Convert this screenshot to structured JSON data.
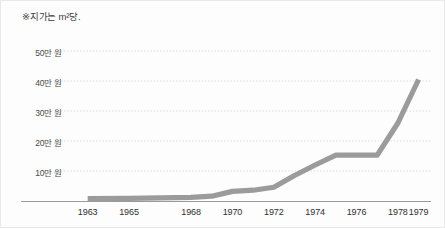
{
  "figure": {
    "note": "※지가는 m²당.",
    "background_color": "#fdfdfd",
    "border_color": "#e9e9e9"
  },
  "chart_data": {
    "type": "line",
    "title": "",
    "subtitle": "",
    "note": "※지가는 m²당.",
    "xlabel": "",
    "ylabel": "",
    "unit": "만 원",
    "line_color": "#9b9b9b",
    "grid_color": "#dcdcdc",
    "axis_color": "#9a9a9a",
    "grid": true,
    "legend": "none",
    "xlim": [
      1962,
      1979.6
    ],
    "ylim": [
      0,
      55
    ],
    "ytick_labels": [
      "50만 원",
      "40만 원",
      "30만 원",
      "20만 원",
      "10만 원"
    ],
    "ytick_values": [
      50,
      40,
      30,
      20,
      10
    ],
    "xtick_labels": [
      "1963",
      "1965",
      "1968",
      "1970",
      "1972",
      "1974",
      "1976",
      "1978",
      "1979"
    ],
    "xtick_values": [
      1963,
      1965,
      1968,
      1970,
      1972,
      1974,
      1976,
      1978,
      1979
    ],
    "x": [
      1963,
      1965,
      1968,
      1969,
      1970,
      1971,
      1972,
      1973,
      1974,
      1975,
      1977,
      1978,
      1979
    ],
    "values": [
      0.8,
      0.9,
      1.2,
      1.6,
      3.2,
      3.6,
      4.6,
      8.5,
      12.0,
      15.3,
      15.3,
      26.0,
      40.5
    ],
    "series": [
      {
        "name": "지가",
        "values": [
          0.8,
          0.9,
          1.2,
          1.6,
          3.2,
          3.6,
          4.6,
          8.5,
          12.0,
          15.3,
          15.3,
          26.0,
          40.5
        ]
      }
    ]
  }
}
